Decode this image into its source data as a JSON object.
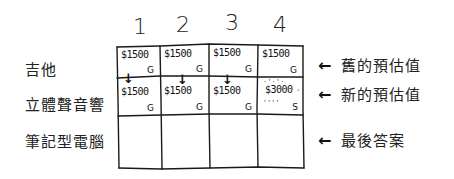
{
  "diagram": {
    "column_headers": [
      "1",
      "2",
      "3",
      "4"
    ],
    "row_labels": [
      "吉他",
      "立體聲音響",
      "筆記型電腦"
    ],
    "rows": [
      {
        "cells": [
          {
            "price": "$1500",
            "item": "G",
            "arrow_down": true
          },
          {
            "price": "$1500",
            "item": "G",
            "arrow_down": true
          },
          {
            "price": "$1500",
            "item": "G",
            "arrow_down": true
          },
          {
            "price": "$1500",
            "item": "G",
            "arrow_down": false
          }
        ]
      },
      {
        "cells": [
          {
            "price": "$1500",
            "item": "G",
            "highlighted": false
          },
          {
            "price": "$1500",
            "item": "G",
            "highlighted": false
          },
          {
            "price": "$1500",
            "item": "G",
            "highlighted": false
          },
          {
            "price": "$3000",
            "item": "S",
            "highlighted": true
          }
        ]
      },
      {
        "cells": [
          {
            "price": "",
            "item": ""
          },
          {
            "price": "",
            "item": ""
          },
          {
            "price": "",
            "item": ""
          },
          {
            "price": "",
            "item": ""
          }
        ]
      }
    ],
    "annotations": [
      {
        "arrow": "←",
        "label": "舊的預估值"
      },
      {
        "arrow": "←",
        "label": "新的預估值"
      },
      {
        "arrow": "←",
        "label": "最後答案"
      }
    ],
    "stroke_color": "#1a1a1a",
    "background_color": "#ffffff"
  }
}
